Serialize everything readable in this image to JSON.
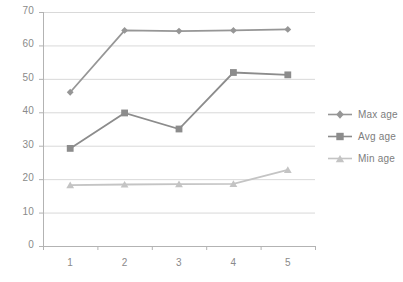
{
  "chart_data": {
    "type": "line",
    "title": "",
    "subtitle": "",
    "xlabel": "",
    "ylabel": "",
    "categories": [
      "1",
      "2",
      "3",
      "4",
      "5"
    ],
    "x_tick_labels": [
      "1",
      "2",
      "3",
      "4",
      "5"
    ],
    "y_tick_labels": [
      "0",
      "10",
      "20",
      "30",
      "40",
      "50",
      "60",
      "70"
    ],
    "ylim": [
      0,
      70
    ],
    "y_tick_step": 10,
    "grid": {
      "horizontal": true,
      "vertical": false,
      "color": "#d9d9d9"
    },
    "legend_position": "right",
    "series": [
      {
        "name": "Max age",
        "marker": "diamond",
        "color": "#969696",
        "values": [
          46,
          64.5,
          64.3,
          64.5,
          64.8
        ]
      },
      {
        "name": "Avg age",
        "marker": "square",
        "color": "#8c8c8c",
        "values": [
          29.2,
          39.8,
          35,
          51.9,
          51.2
        ]
      },
      {
        "name": "Min age",
        "marker": "triangle",
        "color": "#c4c4c4",
        "values": [
          18.2,
          18.4,
          18.5,
          18.6,
          22.8
        ]
      }
    ]
  },
  "legend": {
    "items": [
      {
        "label": "Max age"
      },
      {
        "label": "Avg age"
      },
      {
        "label": "Min age"
      }
    ]
  },
  "colors": {
    "max_age": "#969696",
    "avg_age": "#8c8c8c",
    "min_age": "#c4c4c4",
    "grid": "#d9d9d9",
    "axis": "#b3b3b3",
    "tick_text": "#8a8a8a",
    "legend_text": "#7d7d7d",
    "background": "#ffffff"
  }
}
